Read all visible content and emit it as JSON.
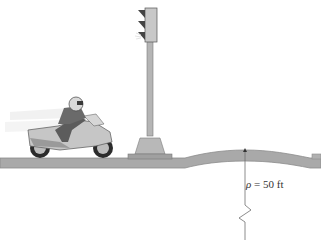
{
  "diagram": {
    "radius_label": {
      "symbol": "ρ",
      "equals": " = ",
      "value": "50 ft"
    },
    "colors": {
      "road": "#a9a9a9",
      "road_top": "#8c8c8c",
      "pole": "#b5b5b5",
      "light_housing": "#c8c8c8",
      "visor": "#3a3a3a",
      "line": "#6e6e6e"
    }
  }
}
